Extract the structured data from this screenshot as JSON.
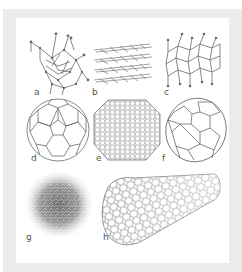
{
  "figure": {
    "panels": [
      {
        "id": "a",
        "label": "a",
        "structure": "diamond"
      },
      {
        "id": "b",
        "label": "b",
        "structure": "graphite"
      },
      {
        "id": "c",
        "label": "c",
        "structure": "lonsdaleite"
      },
      {
        "id": "d",
        "label": "d",
        "structure": "C60 buckminsterfullerene"
      },
      {
        "id": "e",
        "label": "e",
        "structure": "C540 fullerene"
      },
      {
        "id": "f",
        "label": "f",
        "structure": "C70 fullerene"
      },
      {
        "id": "g",
        "label": "g",
        "structure": "amorphous carbon"
      },
      {
        "id": "h",
        "label": "h",
        "structure": "single-walled carbon nanotube"
      }
    ]
  },
  "colors": {
    "frame": "#ececec",
    "panel": "#ffffff",
    "stroke": "#6a6a6a",
    "label": "#555555"
  }
}
